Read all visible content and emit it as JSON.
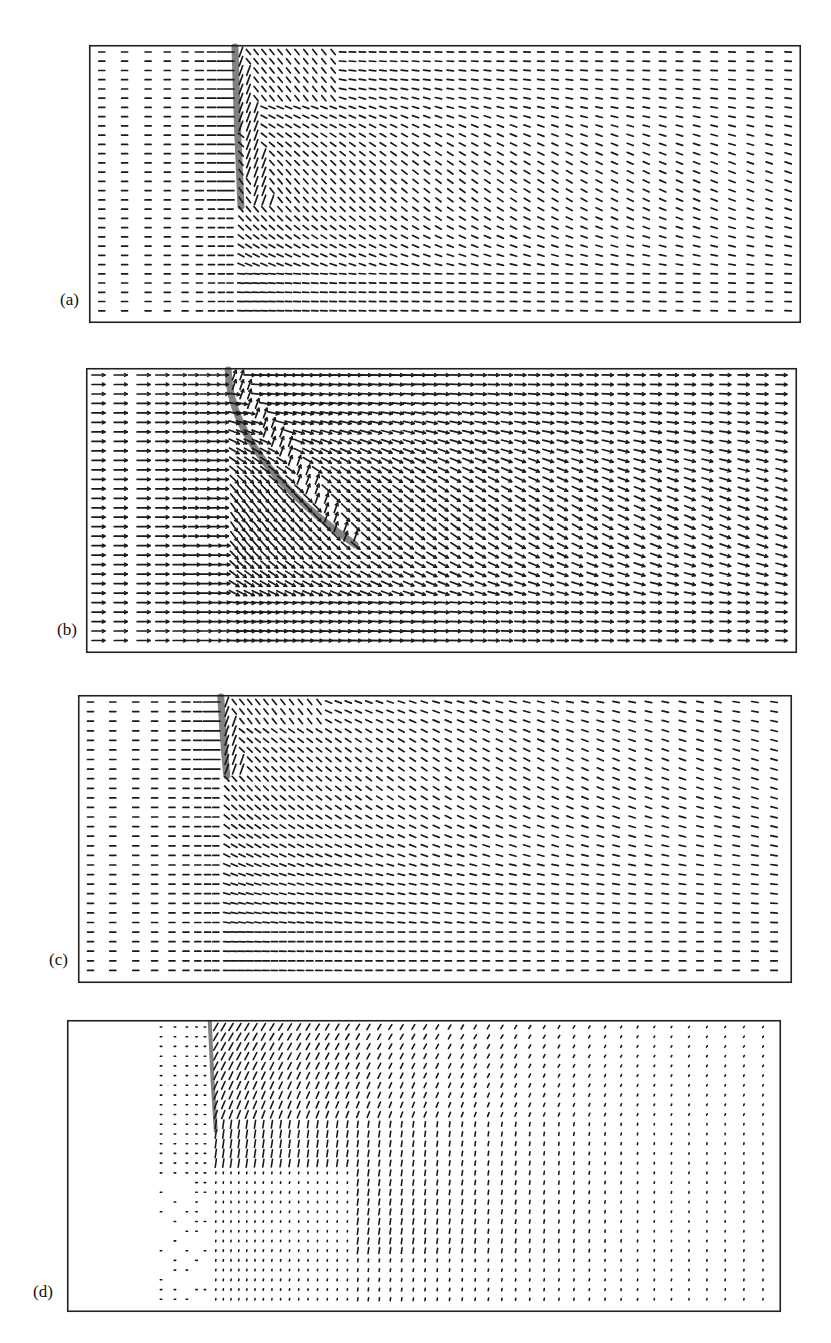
{
  "figure": {
    "background": "#ffffff",
    "frame_color": "#222222",
    "vector_color": "#1a1a1a"
  },
  "chart_data": [
    {
      "type": "quiver",
      "label": "(a)",
      "title": "",
      "xlabel": "",
      "ylabel": "",
      "grid": false,
      "frame": {
        "x": 89,
        "y": 45,
        "w": 712,
        "h": 278
      },
      "label_pos": {
        "x": 60,
        "y": 290
      },
      "rows": 29,
      "jet_x_frac": 0.205,
      "jet_depth_frac": 0.58,
      "style": "dash",
      "flow": "jet-in-crossflow, downward-deflected wake, no arrowheads",
      "description": "Uniform left-to-right crossflow; dense vertical jet plume near x≈0.2 of width penetrating ~58% depth; downstream vectors tilt downward (south-east) then recover to horizontal near bottom."
    },
    {
      "type": "quiver",
      "label": "(b)",
      "title": "",
      "xlabel": "",
      "ylabel": "",
      "grid": false,
      "frame": {
        "x": 86,
        "y": 368,
        "w": 711,
        "h": 285
      },
      "label_pos": {
        "x": 57,
        "y": 620
      },
      "rows": 29,
      "jet_x_frac": 0.2,
      "jet_depth_frac": 0.62,
      "style": "arrow",
      "flow": "jet-in-crossflow, long arrows with heads, plume bends diagonally downstream",
      "description": "Long horizontal arrows with heads; plume starts at top near x≈0.2 and bends diagonally down-right toward ~0.3 width at 60% depth; downstream vectors angle down-right."
    },
    {
      "type": "quiver",
      "label": "(c)",
      "title": "",
      "xlabel": "",
      "ylabel": "",
      "grid": false,
      "frame": {
        "x": 78,
        "y": 695,
        "w": 714,
        "h": 288
      },
      "label_pos": {
        "x": 49,
        "y": 950
      },
      "rows": 29,
      "jet_x_frac": 0.2,
      "jet_depth_frac": 0.28,
      "style": "dash",
      "flow": "jet-in-crossflow, shallow plume",
      "description": "Short plume near top at x≈0.2 penetrating ~28% depth; downstream region of south-east tilted vectors spanning the middle; horizontal flow in lower-left."
    },
    {
      "type": "quiver",
      "label": "(d)",
      "title": "",
      "xlabel": "",
      "ylabel": "",
      "grid": false,
      "frame": {
        "x": 67,
        "y": 1020,
        "w": 714,
        "h": 292
      },
      "label_pos": {
        "x": 33,
        "y": 1282
      },
      "rows": 29,
      "jet_x_frac": 0.2,
      "jet_depth_frac": 0.38,
      "style": "dot",
      "flow": "velocity difference field, mostly dots, upward/right tilted vectors downstream of jet",
      "description": "Left quarter blank; dense vertical streak at x≈0.2 down to ~38% depth; field of short vectors tilted up-right (north-east) downstream, fading to dots toward right and bottom-left."
    }
  ]
}
